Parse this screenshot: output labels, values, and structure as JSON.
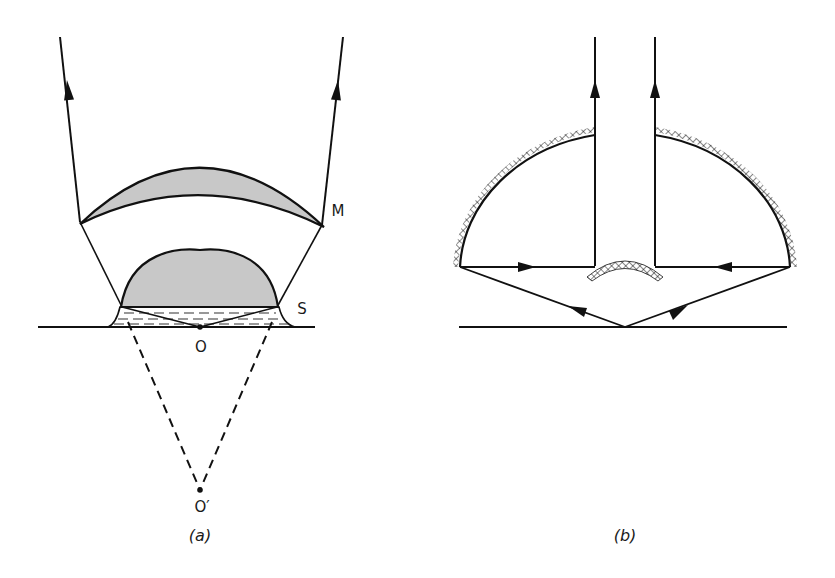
{
  "figure": {
    "panels": [
      {
        "id": "a",
        "caption": "(a)",
        "labels": {
          "mirror": "M",
          "sample": "S",
          "origin": "O",
          "virtual_origin": "O′"
        },
        "elements": [
          "outgoing-ray-left",
          "outgoing-ray-right",
          "crescent-mirror-M",
          "dome-lens-S",
          "immersion-liquid",
          "substrate-baseline",
          "virtual-rays-dashed"
        ]
      },
      {
        "id": "b",
        "caption": "(b)",
        "labels": {},
        "elements": [
          "hemispherical-concave-mirror",
          "central-convex-mirror",
          "vertical-output-rays",
          "horizontal-rays",
          "incident-rays",
          "substrate-baseline"
        ]
      }
    ],
    "colors": {
      "line": "#111111",
      "fill_gray": "#c8c8c8",
      "background": "#ffffff"
    }
  }
}
